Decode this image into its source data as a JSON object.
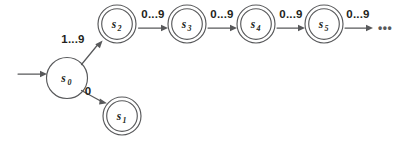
{
  "diagram": {
    "background_color": "#ffffff",
    "stroke_color": "#58595b",
    "text_color": "#231f20",
    "states": [
      {
        "id": "s0",
        "label_base": "s",
        "label_sub": "0",
        "accepting": false,
        "start": true,
        "cx": 67,
        "cy": 78,
        "r_outer": 20.5,
        "r_inner": 20.5
      },
      {
        "id": "s1",
        "label_base": "s",
        "label_sub": "1",
        "accepting": true,
        "start": false,
        "cx": 122,
        "cy": 116,
        "r_outer": 19,
        "r_inner": 15.3
      },
      {
        "id": "s2",
        "label_base": "s",
        "label_sub": "2",
        "accepting": true,
        "start": false,
        "cx": 117,
        "cy": 24,
        "r_outer": 19,
        "r_inner": 15.3
      },
      {
        "id": "s3",
        "label_base": "s",
        "label_sub": "3",
        "accepting": true,
        "start": false,
        "cx": 187,
        "cy": 24,
        "r_outer": 19,
        "r_inner": 15.3
      },
      {
        "id": "s4",
        "label_base": "s",
        "label_sub": "4",
        "accepting": true,
        "start": false,
        "cx": 256,
        "cy": 24,
        "r_outer": 19,
        "r_inner": 15.3
      },
      {
        "id": "s5",
        "label_base": "s",
        "label_sub": "5",
        "accepting": true,
        "start": false,
        "cx": 324,
        "cy": 24,
        "r_outer": 19,
        "r_inner": 15.3
      }
    ],
    "transitions": [
      {
        "id": "start-arrow",
        "from": null,
        "to": "s0",
        "label": "",
        "x1": 18,
        "y1": 74,
        "x2": 44,
        "y2": 74
      },
      {
        "id": "s0-to-s2",
        "from": "s0",
        "to": "s2",
        "label": "1...9",
        "label_x": 73,
        "label_y": 43,
        "x1": 81,
        "y1": 64,
        "x2": 101,
        "y2": 41
      },
      {
        "id": "s0-to-s1",
        "from": "s0",
        "to": "s1",
        "label": "0",
        "label_x": 88,
        "label_y": 95,
        "x1": 81,
        "y1": 91,
        "x2": 105,
        "y2": 104
      },
      {
        "id": "s2-to-s3",
        "from": "s2",
        "to": "s3",
        "label": "0...9",
        "label_x": 153,
        "label_y": 18,
        "x1": 139,
        "y1": 28,
        "x2": 165,
        "y2": 28
      },
      {
        "id": "s3-to-s4",
        "from": "s3",
        "to": "s4",
        "label": "0...9",
        "label_x": 222,
        "label_y": 18,
        "x1": 209,
        "y1": 28,
        "x2": 234,
        "y2": 28
      },
      {
        "id": "s4-to-s5",
        "from": "s4",
        "to": "s5",
        "label": "0...9",
        "label_x": 291,
        "label_y": 18,
        "x1": 278,
        "y1": 28,
        "x2": 302,
        "y2": 28
      },
      {
        "id": "s5-to-more",
        "from": "s5",
        "to": null,
        "label": "0...9",
        "label_x": 358,
        "label_y": 18,
        "x1": 346,
        "y1": 28,
        "x2": 372,
        "y2": 28
      }
    ],
    "continuation": {
      "label": "•••",
      "x": 377,
      "y": 32
    }
  }
}
